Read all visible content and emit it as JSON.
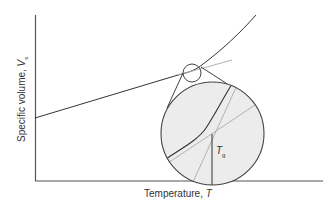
{
  "diagram": {
    "type": "glass-transition-specific-volume",
    "y_axis_label": "Specific volume, ",
    "y_axis_symbol": "V",
    "y_axis_subscript": "s",
    "x_axis_label": "Temperature, ",
    "x_axis_symbol": "T",
    "annotation_symbol": "T",
    "annotation_subscript": "g",
    "colors": {
      "axis": "#555555",
      "curve": "#333333",
      "extrapolation": "#aaaaaa",
      "magnifier_fill": "#ececec",
      "magnifier_stroke": "#444444"
    }
  }
}
